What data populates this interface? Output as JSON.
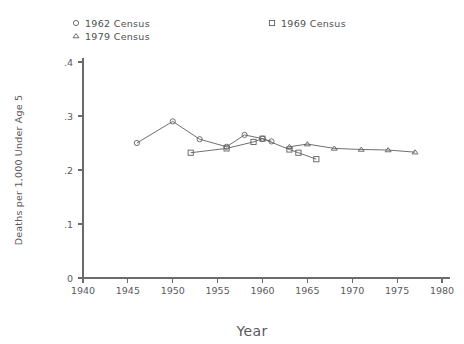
{
  "chart_data": {
    "type": "line",
    "title": "",
    "subtitle": "",
    "xlabel": "Year",
    "ylabel": "Deaths per 1,000 Under Age 5",
    "xlim": [
      1940,
      1980
    ],
    "ylim": [
      0,
      0.4
    ],
    "xticks": [
      1940,
      1945,
      1950,
      1955,
      1960,
      1965,
      1970,
      1975,
      1980
    ],
    "xticklabels": [
      "1940",
      "1945",
      "1950",
      "1955",
      "1960",
      "1965",
      "1970",
      "1975",
      "1980"
    ],
    "yticks": [
      0,
      0.1,
      0.2,
      0.3,
      0.4
    ],
    "yticklabels": [
      "0",
      ".1",
      ".2",
      ".3",
      ".4"
    ],
    "grid": false,
    "legend_position": "top",
    "line_color": "#5f5f5f",
    "axis_color": "#6b6b6b",
    "text_color": "#5a5a5a",
    "series": [
      {
        "name": "1962 Census",
        "marker": "circle",
        "x": [
          1946,
          1950,
          1953,
          1956,
          1958,
          1960,
          1961
        ],
        "values": [
          0.25,
          0.29,
          0.257,
          0.243,
          0.265,
          0.258,
          0.253
        ]
      },
      {
        "name": "1969 Census",
        "marker": "square",
        "x": [
          1952,
          1956,
          1959,
          1960,
          1963,
          1964,
          1966
        ],
        "values": [
          0.232,
          0.24,
          0.252,
          0.258,
          0.238,
          0.232,
          0.22
        ]
      },
      {
        "name": "1979 Census",
        "marker": "triangle",
        "x": [
          1963,
          1965,
          1968,
          1971,
          1974,
          1977
        ],
        "values": [
          0.243,
          0.248,
          0.24,
          0.238,
          0.237,
          0.233
        ]
      }
    ]
  },
  "legend": {
    "entries": [
      {
        "label": "1962 Census",
        "marker": "circle-marker",
        "column": 1,
        "row": 1
      },
      {
        "label": "1979 Census",
        "marker": "triangle-marker",
        "column": 1,
        "row": 2
      },
      {
        "label": "1969 Census",
        "marker": "square-marker",
        "column": 2,
        "row": 1
      }
    ]
  }
}
